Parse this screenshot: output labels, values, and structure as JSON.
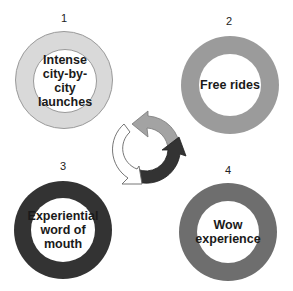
{
  "diagram": {
    "type": "cycle",
    "steps": [
      {
        "number": "1",
        "label": "Intense\ncity-by-city\nlaunches",
        "ring_color": "#d8d8d8",
        "ring_border": "#aaaaaa"
      },
      {
        "number": "2",
        "label": "Free rides",
        "ring_color": "#9a9a9a",
        "ring_border": "#9a9a9a"
      },
      {
        "number": "3",
        "label": "Experiential\nword of\nmouth",
        "ring_color": "#333333",
        "ring_border": "#333333"
      },
      {
        "number": "4",
        "label": "Wow\nexperience",
        "ring_color": "#6e6e6e",
        "ring_border": "#6e6e6e"
      }
    ],
    "center_arrows": {
      "description": "circular cycle of three arrows",
      "colors": [
        "#ffffff",
        "#a0a0a0",
        "#333333"
      ]
    }
  }
}
